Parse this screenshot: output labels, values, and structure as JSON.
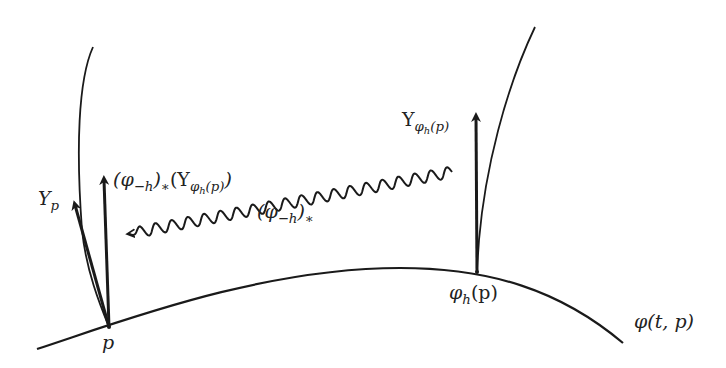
{
  "diagram": {
    "colors": {
      "stroke": "#1a1a1a",
      "text": "#222222",
      "background": "#ffffff"
    },
    "labels": {
      "p": "p",
      "phi_h_p": {
        "base": "φ",
        "sub": "h",
        "rest": "(p)"
      },
      "phi_t_p": "φ(t, p)",
      "Y_p": {
        "base": "Y",
        "sub": "p"
      },
      "Y_phi_h_p": {
        "base": "Y",
        "sub": "φ",
        "subsub": "h",
        "subrest": "(p)"
      },
      "pushforward_vector": {
        "open": "(φ",
        "sub1": "−h",
        "mid": ")",
        "star": "∗",
        "open2": "(Y",
        "sub2": "φ",
        "subsub2": "h",
        "subrest2": "(p)",
        "close": ")"
      },
      "pushforward_map": {
        "open": "(φ",
        "sub": "−h",
        "close": ")",
        "star": "∗"
      }
    },
    "elements": [
      "integral-curve φ(t,p)",
      "left fiber curve through p",
      "right fiber curve through φ_h(p)",
      "vector Y_p at p",
      "vector (φ_-h)_*(Y_φh(p)) at p",
      "vector Y_φh(p) at φ_h(p)",
      "wavy arrow representing (φ_-h)_* mapping from φ_h(p) to p"
    ]
  }
}
